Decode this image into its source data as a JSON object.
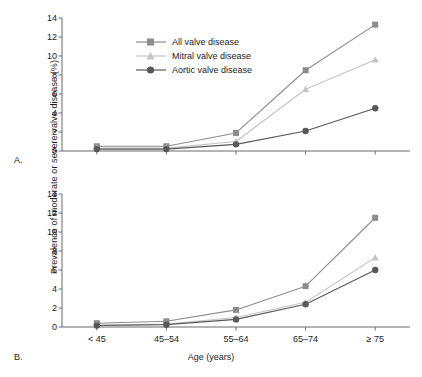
{
  "figure": {
    "ylabel": "Prevalence of moderate or severe valve disease (%)",
    "xlabel": "Age (years)",
    "panel_a_label": "A.",
    "panel_b_label": "B."
  },
  "legend": {
    "position": "top-left-panel-a",
    "entries": [
      {
        "label": "All valve disease",
        "marker": "square",
        "color": "#8c8c8c"
      },
      {
        "label": "Mitral valve disease",
        "marker": "triangle",
        "color": "#c4c4c4"
      },
      {
        "label": "Aortic valve disease",
        "marker": "circle",
        "color": "#585858"
      }
    ]
  },
  "chart_data": [
    {
      "type": "line",
      "panel": "A.",
      "title": "",
      "xlabel": "Age (years)",
      "ylabel": "Prevalence of moderate or severe valve disease (%)",
      "categories": [
        "< 45",
        "45–54",
        "55–64",
        "65–74",
        "≥ 75"
      ],
      "ylim": [
        0,
        14
      ],
      "yticks": [
        0,
        2,
        4,
        6,
        8,
        10,
        12,
        14
      ],
      "grid": false,
      "legend_position": "upper left",
      "series": [
        {
          "name": "All valve disease",
          "marker": "square",
          "color": "#8c8c8c",
          "values": [
            0.5,
            0.5,
            1.9,
            8.5,
            13.3
          ]
        },
        {
          "name": "Mitral valve disease",
          "marker": "triangle",
          "color": "#c4c4c4",
          "values": [
            0.3,
            0.3,
            1.0,
            6.5,
            9.6
          ]
        },
        {
          "name": "Aortic valve disease",
          "marker": "circle",
          "color": "#585858",
          "values": [
            0.2,
            0.2,
            0.7,
            2.1,
            4.5
          ]
        }
      ]
    },
    {
      "type": "line",
      "panel": "B.",
      "title": "",
      "xlabel": "Age (years)",
      "ylabel": "Prevalence of moderate or severe valve disease (%)",
      "categories": [
        "< 45",
        "45–54",
        "55–64",
        "65–74",
        "≥ 75"
      ],
      "ylim": [
        0,
        14
      ],
      "yticks": [
        0,
        2,
        4,
        6,
        8,
        10,
        12,
        14
      ],
      "grid": false,
      "legend_position": "none",
      "series": [
        {
          "name": "All valve disease",
          "marker": "square",
          "color": "#8c8c8c",
          "values": [
            0.4,
            0.6,
            1.8,
            4.3,
            11.5
          ]
        },
        {
          "name": "Mitral valve disease",
          "marker": "triangle",
          "color": "#c4c4c4",
          "values": [
            0.2,
            0.3,
            1.0,
            2.6,
            7.3
          ]
        },
        {
          "name": "Aortic valve disease",
          "marker": "circle",
          "color": "#585858",
          "values": [
            0.15,
            0.25,
            0.8,
            2.4,
            6.0
          ]
        }
      ]
    }
  ]
}
